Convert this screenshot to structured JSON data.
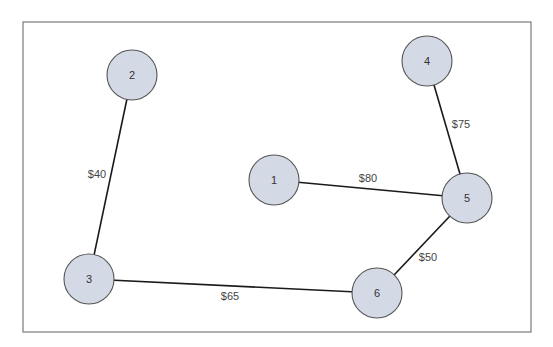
{
  "diagram": {
    "type": "network-graph",
    "frame": {
      "x": 23,
      "y": 22,
      "width": 508,
      "height": 310
    },
    "colors": {
      "node_fill": "#d3dae6",
      "node_stroke": "#555555",
      "edge": "#1a1a1a",
      "frame": "#7a7a7a"
    },
    "nodes": [
      {
        "id": "1",
        "label": "1",
        "cx": 274,
        "cy": 180,
        "r": 25
      },
      {
        "id": "2",
        "label": "2",
        "cx": 132,
        "cy": 75,
        "r": 25
      },
      {
        "id": "3",
        "label": "3",
        "cx": 89,
        "cy": 279,
        "r": 25
      },
      {
        "id": "4",
        "label": "4",
        "cx": 427,
        "cy": 61,
        "r": 25
      },
      {
        "id": "5",
        "label": "5",
        "cx": 467,
        "cy": 198,
        "r": 25
      },
      {
        "id": "6",
        "label": "6",
        "cx": 377,
        "cy": 293,
        "r": 25
      }
    ],
    "edges": [
      {
        "from": "2",
        "to": "3",
        "label": "$40",
        "lx": 97,
        "ly": 174
      },
      {
        "from": "4",
        "to": "5",
        "label": "$75",
        "lx": 461,
        "ly": 124
      },
      {
        "from": "1",
        "to": "5",
        "label": "$80",
        "lx": 368,
        "ly": 178
      },
      {
        "from": "5",
        "to": "6",
        "label": "$50",
        "lx": 428,
        "ly": 257
      },
      {
        "from": "3",
        "to": "6",
        "label": "$65",
        "lx": 230,
        "ly": 296
      }
    ]
  }
}
